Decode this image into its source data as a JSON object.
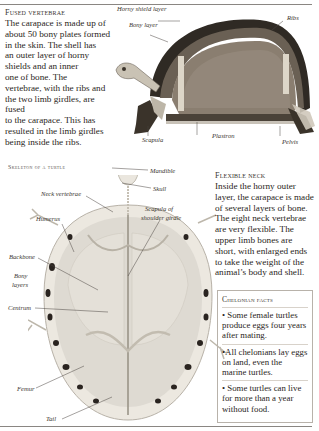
{
  "fused_vertebrae": {
    "heading": "Fused vertebrae",
    "lines": [
      "The carapace is made up of",
      "about 50 bony plates formed",
      "in the skin. The shell has",
      "an outer layer of horny",
      "shields and an inner",
      "one of bone. The",
      "vertebrae, with the ribs and",
      "the two limb girdles, are fused",
      "to the carapace. This has",
      "resulted in the limb girdles",
      "being inside the ribs."
    ]
  },
  "shell_diagram": {
    "labels": {
      "horny_shield_layer": "Horny shield layer",
      "bony_layer": "Bony layer",
      "ribs": "Ribs",
      "scapula": "Scapula",
      "plastron": "Plastron",
      "pelvis": "Pelvis"
    }
  },
  "skeleton_diagram": {
    "title": "Skeleton of a turtle",
    "labels": {
      "mandible": "Mandible",
      "skull": "Skull",
      "neck_vertebrae": "Neck vertebrae",
      "scapula_of_shoulder_girdle_1": "Scapula of",
      "scapula_of_shoulder_girdle_2": "shoulder girdle",
      "humerus": "Humerus",
      "backbone": "Backbone",
      "bony_layers_1": "Bony",
      "bony_layers_2": "layers",
      "centrum": "Centrum",
      "femur": "Femur",
      "tail": "Tail"
    }
  },
  "flexible_neck": {
    "heading": "Flexible neck",
    "lines": [
      "Inside the horny outer",
      "layer, the carapace is made",
      "of several layers of bone.",
      "The eight neck vertebrae",
      "are very flexible. The",
      "upper limb bones are",
      "short, with enlarged ends",
      "to take the weight of the",
      "animal’s body and shell."
    ]
  },
  "chelonian_facts": {
    "heading": "Chelonian facts",
    "facts": [
      "• Some female turtles produce eggs four years after mating.",
      "•All chelonians lay eggs on land, even the marine turtles.",
      "• Some turtles can live for more than a year without food."
    ]
  },
  "colors": {
    "shell_dark": "#3a342c",
    "shell_inner": "#8a7e70",
    "bone": "#e8e4dc",
    "spot": "#2a2420",
    "rule": "#8a8682"
  }
}
